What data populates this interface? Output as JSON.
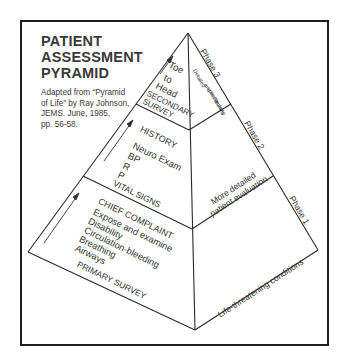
{
  "title": {
    "lines": [
      "PATIENT",
      "ASSESSMENT",
      "PYRAMID"
    ]
  },
  "credit": {
    "lines": [
      "Adapted from “Pyramid",
      "of Life” by Ray Johnson,",
      "JEMS. June, 1985,",
      "pp. 56-58."
    ]
  },
  "pyramid": {
    "left_face": {
      "secondary_survey": {
        "items": [
          "Toe",
          "to",
          "Head"
        ],
        "heading": "SECONDARY",
        "heading2": "SURVEY"
      },
      "vital_signs": {
        "heading_top": "HISTORY",
        "items": [
          "Neuro Exam",
          "BP",
          "R",
          "P"
        ],
        "heading": "VITAL SIGNS"
      },
      "primary_survey": {
        "heading_top": "CHIEF COMPLAINT",
        "items": [
          "Expose and examine",
          "Disability",
          "Circulation-bleeding",
          "Breathing",
          "Airways"
        ],
        "heading": "PRIMARY SURVEY"
      }
    },
    "right_face": {
      "phase3": {
        "label": "Phase 3",
        "description": [
          "Detailed",
          "and",
          "specific",
          "secondary",
          "survey"
        ]
      },
      "phase2": {
        "label": "Phase 2",
        "description": [
          "More detailed",
          "patient evaluation"
        ]
      },
      "phase1": {
        "label": "Phase 1",
        "description": [
          "Life-threatening conditions"
        ]
      }
    }
  },
  "colors": {
    "line": "#2a2a2a",
    "frame": "#1f1f1f",
    "text": "#333333"
  }
}
